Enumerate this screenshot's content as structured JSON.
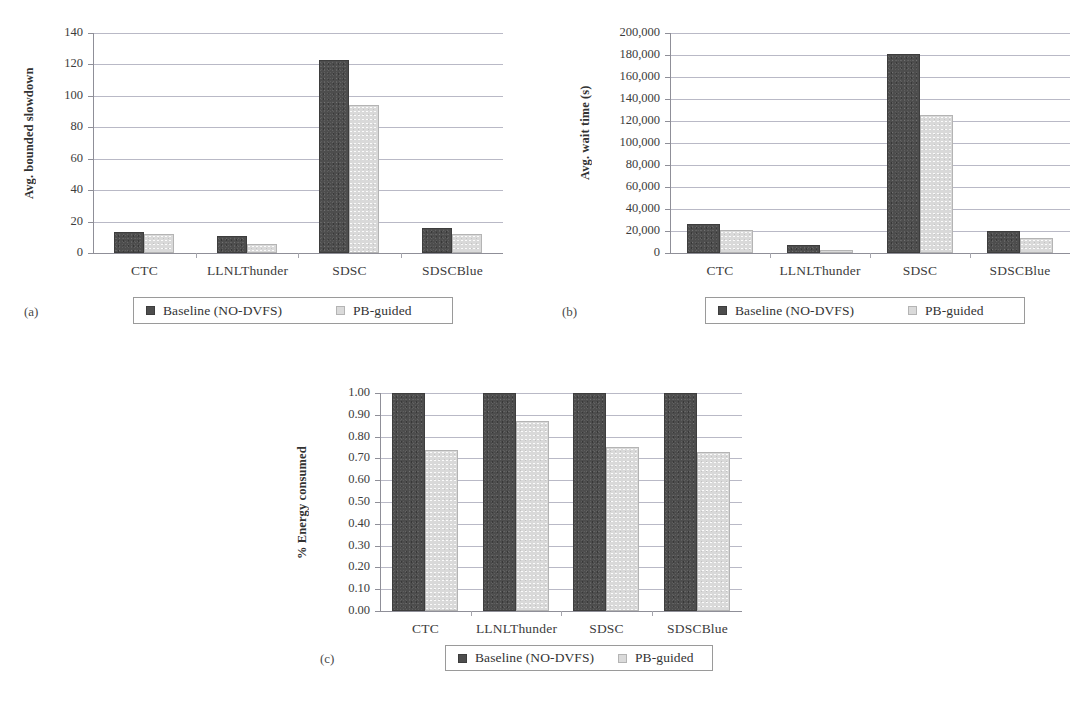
{
  "page": {
    "background": "#ffffff",
    "colors": {
      "series_dark": "#4d4d4d",
      "series_light": "#d9d9d9",
      "grid": "#b9b9c6",
      "axis": "#8f8f98",
      "text": "#3c3c3c"
    }
  },
  "legend": {
    "series": [
      {
        "label": "Baseline (NO-DVFS)",
        "swatch": "dark-swatch-icon",
        "color": "#4d4d4d"
      },
      {
        "label": "PB-guided",
        "swatch": "light-swatch-icon",
        "color": "#d9d9d9"
      }
    ]
  },
  "captions": {
    "a": "(a)",
    "b": "(b)",
    "c": "(c)"
  },
  "chart_data": [
    {
      "id": "a",
      "type": "bar",
      "title": "",
      "xlabel": "",
      "ylabel": "Avg. bounded slowdown",
      "categories": [
        "CTC",
        "LLNLThunder",
        "SDSC",
        "SDSCBlue"
      ],
      "series": [
        {
          "name": "Baseline (NO-DVFS)",
          "values": [
            13.5,
            11,
            123,
            16
          ]
        },
        {
          "name": "PB-guided",
          "values": [
            12,
            6,
            94,
            12
          ]
        }
      ],
      "ylim": [
        0,
        140
      ],
      "ytick_step": 20,
      "yticks": [
        "0",
        "20",
        "40",
        "60",
        "80",
        "100",
        "120",
        "140"
      ],
      "grid": true,
      "legend_position": "bottom"
    },
    {
      "id": "b",
      "type": "bar",
      "title": "",
      "xlabel": "",
      "ylabel": "Avg. wait time (s)",
      "categories": [
        "CTC",
        "LLNLThunder",
        "SDSC",
        "SDSCBlue"
      ],
      "series": [
        {
          "name": "Baseline (NO-DVFS)",
          "values": [
            26000,
            7000,
            180500,
            20000
          ]
        },
        {
          "name": "PB-guided",
          "values": [
            20500,
            2500,
            125500,
            14000
          ]
        }
      ],
      "ylim": [
        0,
        200000
      ],
      "ytick_step": 20000,
      "yticks": [
        "0",
        "20,000",
        "40,000",
        "60,000",
        "80,000",
        "100,000",
        "120,000",
        "140,000",
        "160,000",
        "180,000",
        "200,000"
      ],
      "grid": true,
      "legend_position": "bottom"
    },
    {
      "id": "c",
      "type": "bar",
      "title": "",
      "xlabel": "",
      "ylabel": "% Energy consumed",
      "categories": [
        "CTC",
        "LLNLThunder",
        "SDSC",
        "SDSCBlue"
      ],
      "series": [
        {
          "name": "Baseline (NO-DVFS)",
          "values": [
            1.0,
            1.0,
            1.0,
            1.0
          ]
        },
        {
          "name": "PB-guided",
          "values": [
            0.74,
            0.87,
            0.75,
            0.73
          ]
        }
      ],
      "ylim": [
        0,
        1.0
      ],
      "ytick_step": 0.1,
      "yticks": [
        "0.00",
        "0.10",
        "0.20",
        "0.30",
        "0.40",
        "0.50",
        "0.60",
        "0.70",
        "0.80",
        "0.90",
        "1.00"
      ],
      "grid": true,
      "legend_position": "bottom"
    }
  ]
}
